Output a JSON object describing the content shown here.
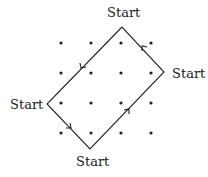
{
  "diagram": {
    "type": "grid-loop-path",
    "grid": {
      "columns": 4,
      "rows": 4,
      "x": [
        61,
        91,
        121,
        151
      ],
      "y": [
        43,
        73,
        103,
        133
      ],
      "dot_color": "#222222"
    },
    "path": {
      "vertices": [
        {
          "name": "top",
          "x": 122,
          "y": 27
        },
        {
          "name": "left",
          "x": 47,
          "y": 104
        },
        {
          "name": "bottom",
          "x": 90,
          "y": 149
        },
        {
          "name": "right",
          "x": 164,
          "y": 72
        }
      ],
      "direction": "counterclockwise",
      "stroke_color": "#222222"
    },
    "labels": {
      "top": "Start",
      "right": "Start",
      "left": "Start",
      "bottom": "Start"
    }
  }
}
